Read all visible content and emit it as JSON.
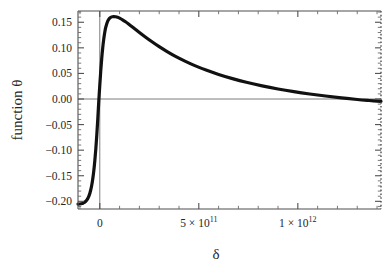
{
  "chart_data": {
    "type": "line",
    "title": "",
    "subtitle": "",
    "xlabel": "δ",
    "ylabel": "function θ",
    "xlim": [
      -110000000000.0,
      1420000000000.0
    ],
    "ylim": [
      -0.215,
      0.172
    ],
    "grid": false,
    "legend": null,
    "x_ticks": [
      {
        "value": 0,
        "label": "0"
      },
      {
        "value": 500000000000,
        "label": "5 × 10",
        "exponent": "11"
      },
      {
        "value": 1000000000000,
        "label": "1 × 10",
        "exponent": "12"
      }
    ],
    "y_ticks": [
      {
        "value": 0.15,
        "label": "0.15"
      },
      {
        "value": 0.1,
        "label": "0.10"
      },
      {
        "value": 0.05,
        "label": "0.05"
      },
      {
        "value": 0.0,
        "label": "0.00"
      },
      {
        "value": -0.05,
        "label": "-0.05"
      },
      {
        "value": -0.1,
        "label": "-0.10"
      },
      {
        "value": -0.15,
        "label": "-0.15"
      },
      {
        "value": -0.2,
        "label": "-0.20"
      }
    ],
    "zero_lines": {
      "horizontal_y": 0,
      "vertical_x": 0
    },
    "series": [
      {
        "name": "function θ",
        "color": "#111111",
        "line_width": 3.2,
        "x": [
          -110000000000.0,
          -102000000000.0,
          -95000000000.0,
          -90000000000.0,
          -85000000000.0,
          -80000000000.0,
          -75000000000.0,
          -70000000000.0,
          -65000000000.0,
          -60000000000.0,
          -55000000000.0,
          -50000000000.0,
          -45000000000.0,
          -40000000000.0,
          -35000000000.0,
          -30000000000.0,
          -25000000000.0,
          -20000000000.0,
          -15000000000.0,
          -10000000000.0,
          -5000000000.0,
          0.0,
          5000000000.0,
          10000000000.0,
          15000000000.0,
          20000000000.0,
          25000000000.0,
          30000000000.0,
          40000000000.0,
          50000000000.0,
          60000000000.0,
          70000000000.0,
          80000000000.0,
          90000000000.0,
          100000000000.0,
          115000000000.0,
          130000000000.0,
          150000000000.0,
          170000000000.0,
          200000000000.0,
          230000000000.0,
          260000000000.0,
          300000000000.0,
          340000000000.0,
          380000000000.0,
          430000000000.0,
          480000000000.0,
          540000000000.0,
          600000000000.0,
          670000000000.0,
          740000000000.0,
          820000000000.0,
          900000000000.0,
          980000000000.0,
          1060000000000.0,
          1140000000000.0,
          1220000000000.0,
          1300000000000.0,
          1360000000000.0,
          1420000000000.0
        ],
        "y": [
          -0.2055,
          -0.2052,
          -0.2048,
          -0.2043,
          -0.2036,
          -0.2026,
          -0.2013,
          -0.1996,
          -0.1972,
          -0.194,
          -0.1898,
          -0.1842,
          -0.1768,
          -0.1672,
          -0.155,
          -0.1396,
          -0.1206,
          -0.0976,
          -0.0702,
          -0.0386,
          -0.0038,
          0.0268,
          0.0552,
          0.08,
          0.1005,
          0.117,
          0.13,
          0.14,
          0.1522,
          0.158,
          0.1605,
          0.1612,
          0.1608,
          0.1597,
          0.158,
          0.1548,
          0.151,
          0.1452,
          0.1392,
          0.13,
          0.1212,
          0.1128,
          0.1022,
          0.0926,
          0.0838,
          0.074,
          0.0652,
          0.056,
          0.048,
          0.0398,
          0.0326,
          0.0256,
          0.0196,
          0.0144,
          0.0098,
          0.0058,
          0.0022,
          -0.001,
          -0.003,
          -0.0048
        ]
      }
    ],
    "notes": {
      "peak": {
        "x": 70000000000.0,
        "y": 0.1612
      },
      "left_asymptote": -0.2055,
      "zero_crossing_rising": -4500000000.0,
      "zero_crossing_falling": 1295000000000.0,
      "frame": "full box with inward major and minor ticks; right edge drawn dotted"
    }
  },
  "frame": {
    "border_color": "#555555",
    "zero_line_color": "#777777",
    "right_edge_style": "dotted"
  }
}
